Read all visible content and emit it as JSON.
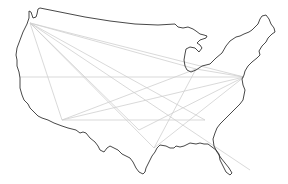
{
  "map": {
    "type": "us-outline-flight-routes",
    "colors": {
      "background": "#ffffff",
      "outline": "#333333",
      "routes": "#cfcfcf"
    },
    "hubs": [
      {
        "id": "seattle",
        "x": 30,
        "y": 23
      },
      {
        "id": "san-francisco",
        "x": 20,
        "y": 77
      },
      {
        "id": "los-angeles",
        "x": 62,
        "y": 120
      },
      {
        "id": "chicago",
        "x": 196,
        "y": 69
      },
      {
        "id": "new-york",
        "x": 244,
        "y": 77
      },
      {
        "id": "dallas",
        "x": 139,
        "y": 130
      },
      {
        "id": "houston",
        "x": 154,
        "y": 148
      },
      {
        "id": "atlanta",
        "x": 205,
        "y": 120
      },
      {
        "id": "miami",
        "x": 250,
        "y": 170
      }
    ],
    "routes": [
      [
        "seattle",
        "chicago"
      ],
      [
        "seattle",
        "new-york"
      ],
      [
        "seattle",
        "dallas"
      ],
      [
        "seattle",
        "houston"
      ],
      [
        "seattle",
        "atlanta"
      ],
      [
        "seattle",
        "miami"
      ],
      [
        "seattle",
        "los-angeles"
      ],
      [
        "san-francisco",
        "new-york"
      ],
      [
        "los-angeles",
        "chicago"
      ],
      [
        "los-angeles",
        "new-york"
      ],
      [
        "los-angeles",
        "atlanta"
      ],
      [
        "chicago",
        "houston"
      ],
      [
        "new-york",
        "dallas"
      ],
      [
        "new-york",
        "houston"
      ],
      [
        "chicago",
        "new-york"
      ]
    ]
  }
}
